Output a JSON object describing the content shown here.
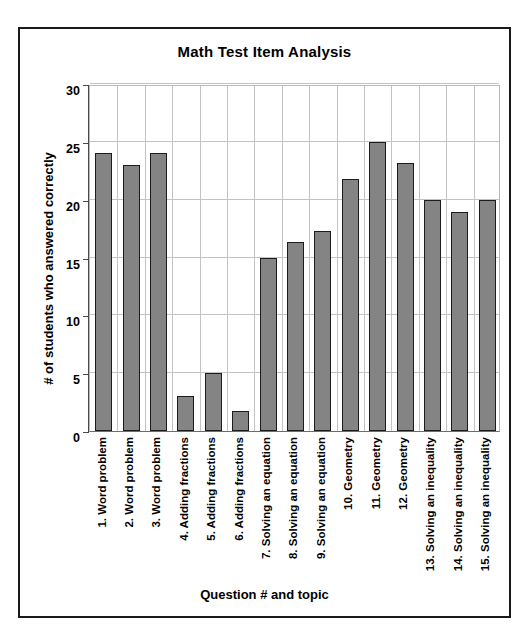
{
  "chart_data": {
    "type": "bar",
    "title": "Math Test Item Analysis",
    "xlabel": "Question # and topic",
    "ylabel": "# of students who answered correctly",
    "ylim": [
      0,
      30
    ],
    "yticks": [
      0,
      5,
      10,
      15,
      20,
      25,
      30
    ],
    "grid": true,
    "legend": "none",
    "bar_color": "#848484",
    "bar_border_color": "#1c1c1c",
    "categories": [
      "1. Word problem",
      "2. Word problem",
      "3. Word problem",
      "4. Adding fractions",
      "5. Adding fractions",
      "6. Adding fractions",
      "7. Solving an equation",
      "8. Solving an equation",
      "9. Solving an equation",
      "10. Geometry",
      "11. Geometry",
      "12. Geometry",
      "13. Solving an inequality",
      "14. Solving an inequality",
      "15. Solving an inequality"
    ],
    "values": [
      24,
      23,
      24,
      3,
      5,
      1.7,
      15,
      16.3,
      17.3,
      21.8,
      25,
      23.2,
      20,
      18.9,
      20
    ]
  }
}
